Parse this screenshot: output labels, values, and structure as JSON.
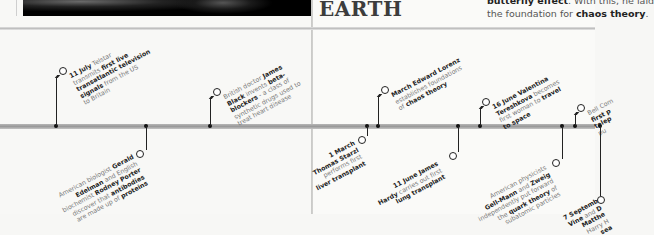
{
  "header": {
    "heading": "EARTH",
    "body_lines": [
      {
        "parts": [
          {
            "t": "butterfly effect",
            "b": true
          },
          {
            "t": ". With this, he laid",
            "b": false
          }
        ]
      },
      {
        "parts": [
          {
            "t": "the foundation for ",
            "b": false
          },
          {
            "t": "chaos theory",
            "b": true
          },
          {
            "t": ".",
            "b": false
          }
        ]
      }
    ]
  },
  "timeline": {
    "events_above": [
      {
        "id": "telstar",
        "x": 56,
        "ring_x": 62,
        "ring_y": 71,
        "lines": [
          [
            {
              "t": "11 July",
              "b": true
            },
            {
              "t": " Telstar",
              "b": false
            }
          ],
          [
            {
              "t": "transmits ",
              "b": false
            },
            {
              "t": "first live",
              "b": true
            }
          ],
          [
            {
              "t": "transatlantic television",
              "b": true
            }
          ],
          [
            {
              "t": "signals",
              "b": true
            },
            {
              "t": " from the US",
              "b": false
            }
          ],
          [
            {
              "t": "to Britain",
              "b": false
            }
          ]
        ]
      },
      {
        "id": "beta-blockers",
        "x": 210,
        "ring_x": 216,
        "ring_y": 92,
        "lines": [
          [
            {
              "t": "British doctor ",
              "b": false
            },
            {
              "t": "James",
              "b": true
            }
          ],
          [
            {
              "t": "Black",
              "b": true
            },
            {
              "t": " invents ",
              "b": false
            },
            {
              "t": "beta-",
              "b": true
            }
          ],
          [
            {
              "t": "blockers",
              "b": true
            },
            {
              "t": " - a class of",
              "b": false
            }
          ],
          [
            {
              "t": "synthetic drugs used to",
              "b": false
            }
          ],
          [
            {
              "t": "treat heart disease",
              "b": false
            }
          ]
        ]
      },
      {
        "id": "lorenz",
        "x": 378,
        "ring_x": 384,
        "ring_y": 90,
        "lines": [
          [
            {
              "t": "March Edward Lorenz",
              "b": true
            }
          ],
          [
            {
              "t": "establishes foundations",
              "b": false
            }
          ],
          [
            {
              "t": "of ",
              "b": false
            },
            {
              "t": "chaos theory",
              "b": true
            }
          ]
        ]
      },
      {
        "id": "tereshkova",
        "x": 480,
        "ring_x": 485,
        "ring_y": 102,
        "lines": [
          [
            {
              "t": "16 June Valentina",
              "b": true
            }
          ],
          [
            {
              "t": "Tereshkova",
              "b": true
            },
            {
              "t": " becomes",
              "b": false
            }
          ],
          [
            {
              "t": "first woman to ",
              "b": false
            },
            {
              "t": "travel",
              "b": true
            }
          ],
          [
            {
              "t": "to space",
              "b": true
            }
          ]
        ]
      },
      {
        "id": "bell",
        "x": 575,
        "ring_x": 580,
        "ring_y": 108,
        "lines": [
          [
            {
              "t": "Bell Com",
              "b": false
            }
          ],
          [
            {
              "t": "first p",
              "b": true
            }
          ],
          [
            {
              "t": "telep",
              "b": true
            }
          ],
          [
            {
              "t": "pu",
              "b": false
            }
          ]
        ]
      }
    ],
    "events_below": [
      {
        "id": "antibodies",
        "x": 146,
        "ring_x": 139,
        "ring_y": 154,
        "lines": [
          [
            {
              "t": "American biologist ",
              "b": false
            },
            {
              "t": "Gerald",
              "b": true
            }
          ],
          [
            {
              "t": "Edelman",
              "b": true
            },
            {
              "t": " and English",
              "b": false
            }
          ],
          [
            {
              "t": "biochemist ",
              "b": false
            },
            {
              "t": "Rodney Porter",
              "b": true
            }
          ],
          [
            {
              "t": "discover that ",
              "b": false
            },
            {
              "t": "antibodies",
              "b": true
            }
          ],
          [
            {
              "t": "are made up of ",
              "b": false
            },
            {
              "t": "proteins",
              "b": true
            }
          ]
        ]
      },
      {
        "id": "starzl",
        "x": 367,
        "ring_x": 361,
        "ring_y": 140,
        "lines": [
          [
            {
              "t": "1 March",
              "b": true
            }
          ],
          [
            {
              "t": "Thomas Starzl",
              "b": true
            }
          ],
          [
            {
              "t": "performs first",
              "b": false
            }
          ],
          [
            {
              "t": "liver transplant",
              "b": true
            }
          ]
        ]
      },
      {
        "id": "hardy",
        "x": 458,
        "ring_x": 452,
        "ring_y": 156,
        "lines": [
          [
            {
              "t": "11 June James",
              "b": true
            }
          ],
          [
            {
              "t": "Hardy",
              "b": true
            },
            {
              "t": " carries out first",
              "b": false
            }
          ],
          [
            {
              "t": "lung transplant",
              "b": true
            }
          ]
        ]
      },
      {
        "id": "quarks",
        "x": 562,
        "ring_x": 555,
        "ring_y": 163,
        "lines": [
          [
            {
              "t": "American physicists",
              "b": false
            }
          ],
          [
            {
              "t": "Gell-Mann",
              "b": true
            },
            {
              "t": " and ",
              "b": false
            },
            {
              "t": "Zweig",
              "b": true
            }
          ],
          [
            {
              "t": "independently put forward",
              "b": false
            }
          ],
          [
            {
              "t": "the ",
              "b": false
            },
            {
              "t": "quark theory",
              "b": true
            },
            {
              "t": " of",
              "b": false
            }
          ],
          [
            {
              "t": "subatomic particles",
              "b": false
            }
          ]
        ]
      },
      {
        "id": "september",
        "x": 600,
        "ring_x": 600,
        "ring_y": 200,
        "lines": [
          [
            {
              "t": "7 Septemb",
              "b": true
            }
          ],
          [
            {
              "t": "Vine",
              "b": true
            },
            {
              "t": " and ",
              "b": false
            },
            {
              "t": "D",
              "b": true
            }
          ],
          [
            {
              "t": "Matthe",
              "b": true
            }
          ],
          [
            {
              "t": "Harry H",
              "b": false
            }
          ],
          [
            {
              "t": "sea",
              "b": true
            }
          ]
        ]
      }
    ]
  }
}
